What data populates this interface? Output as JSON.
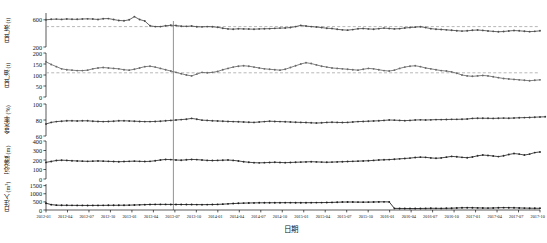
{
  "chart_data": {
    "type": "line",
    "title": "",
    "xlabel": "日期",
    "grid": false,
    "legend": "none",
    "layout": "5 stacked panels sharing one x axis",
    "x": [
      "2012-01",
      "2012-04",
      "2012-07",
      "2012-10",
      "2013-01",
      "2013-04",
      "2013-07",
      "2013-10",
      "2014-01",
      "2014-04",
      "2014-07",
      "2014-10",
      "2015-01",
      "2015-04",
      "2015-07",
      "2015-10",
      "2016-01",
      "2016-04",
      "2016-07",
      "2016-10",
      "2017-01",
      "2017-04",
      "2017-07",
      "2017-10"
    ],
    "xtick_labels": [
      "2012-01",
      "2012-04",
      "2012-07",
      "2012-10",
      "2013-01",
      "2013-04",
      "2013-07",
      "2013-10",
      "2014-01",
      "2014-04",
      "2014-07",
      "2014-10",
      "2015-01",
      "2015-04",
      "2015-07",
      "2015-10",
      "2016-01",
      "2016-04",
      "2016-07",
      "2016-10",
      "2017-01",
      "2017-04",
      "2017-07",
      "2017-10"
    ],
    "marker_line": {
      "x": "2013-06",
      "label": ""
    },
    "panels": [
      {
        "name": "日产液",
        "ylabel": "日产液 (t)",
        "ylim": [
          200,
          700
        ],
        "yticks": [
          200,
          600
        ],
        "ytick_labels": [
          "200",
          "600"
        ],
        "refline": 500,
        "color": "#4d4d4d",
        "values": [
          600,
          607,
          610,
          606,
          612,
          608,
          607,
          612,
          614,
          611,
          605,
          616,
          618,
          604,
          590,
          586,
          600,
          646,
          604,
          582,
          512,
          500,
          500,
          512,
          520,
          516,
          506,
          504,
          508,
          498,
          496,
          500,
          498,
          490,
          476,
          466,
          462,
          468,
          466,
          464,
          462,
          466,
          468,
          470,
          474,
          478,
          480,
          486,
          500,
          518,
          508,
          500,
          494,
          486,
          476,
          472,
          460,
          452,
          448,
          456,
          468,
          472,
          466,
          462,
          470,
          478,
          472,
          466,
          470,
          480,
          486,
          492,
          498,
          486,
          470,
          462,
          458,
          452,
          446,
          440,
          434,
          438,
          446,
          450,
          444,
          436,
          430,
          424,
          428,
          436,
          442,
          438,
          432,
          426,
          430,
          438
        ]
      },
      {
        "name": "日产油",
        "ylabel": "日产油 (t)",
        "ylim": [
          0,
          200
        ],
        "yticks": [
          0,
          50,
          100,
          150,
          200
        ],
        "ytick_labels": [
          "0",
          "50",
          "100",
          "150",
          "200"
        ],
        "refline": 110,
        "color": "#6a6a6a",
        "values": [
          160,
          148,
          138,
          128,
          124,
          122,
          120,
          120,
          122,
          128,
          132,
          134,
          132,
          130,
          128,
          124,
          122,
          126,
          132,
          138,
          140,
          136,
          130,
          124,
          118,
          112,
          106,
          100,
          96,
          104,
          112,
          110,
          112,
          116,
          124,
          130,
          136,
          140,
          142,
          140,
          136,
          132,
          128,
          126,
          124,
          122,
          126,
          134,
          142,
          150,
          156,
          152,
          146,
          140,
          136,
          132,
          130,
          128,
          126,
          124,
          122,
          126,
          130,
          128,
          124,
          120,
          118,
          122,
          130,
          136,
          140,
          142,
          138,
          132,
          128,
          124,
          120,
          118,
          114,
          108,
          100,
          96,
          94,
          96,
          98,
          96,
          92,
          88,
          84,
          82,
          80,
          78,
          76,
          74,
          76,
          78
        ]
      },
      {
        "name": "含水率",
        "ylabel": "含水率 (%)",
        "ylim": [
          60,
          100
        ],
        "yticks": [
          60,
          80,
          100
        ],
        "ytick_labels": [
          "60",
          "80",
          "100"
        ],
        "refline": null,
        "color": "#3a3a3a",
        "values": [
          75,
          77,
          78,
          78.5,
          79,
          79,
          78.8,
          79,
          79,
          78.5,
          78.2,
          78,
          78.2,
          78.5,
          79,
          79,
          78.8,
          78.5,
          78.2,
          78,
          78,
          78.2,
          78.5,
          79,
          79.5,
          80,
          80.5,
          81,
          82,
          81,
          79.8,
          79.5,
          79,
          78.8,
          78.5,
          78.2,
          78,
          77.8,
          77.5,
          77.2,
          77,
          77.5,
          78,
          78.5,
          78.2,
          78,
          77.8,
          77.5,
          77.2,
          77,
          76.8,
          76.5,
          76.2,
          76.5,
          77,
          77.2,
          77,
          76.8,
          77,
          77.5,
          78,
          78.2,
          78.5,
          78.8,
          79,
          79.5,
          80,
          79.8,
          79.5,
          79.2,
          79.5,
          80,
          80.2,
          80,
          80.2,
          80.5,
          80.5,
          80.6,
          80.8,
          80.8,
          81,
          81.2,
          82,
          82.2,
          82.2,
          82.1,
          82,
          82.2,
          82.4,
          82.2,
          82.5,
          82.8,
          83,
          83.2,
          83.5,
          83.8,
          84
        ]
      },
      {
        "name": "沉没度",
        "ylabel": "沉没度 (m)",
        "ylim": [
          0,
          400
        ],
        "yticks": [
          0,
          100,
          200,
          300,
          400
        ],
        "ytick_labels": [
          "0",
          "100",
          "200",
          "300",
          "400"
        ],
        "refline": null,
        "color": "#2a2a2a",
        "values": [
          175,
          185,
          195,
          198,
          196,
          192,
          190,
          188,
          186,
          188,
          190,
          188,
          186,
          184,
          182,
          184,
          186,
          188,
          186,
          184,
          186,
          192,
          200,
          206,
          204,
          200,
          198,
          202,
          206,
          204,
          200,
          196,
          194,
          196,
          198,
          200,
          196,
          190,
          182,
          176,
          172,
          170,
          172,
          174,
          176,
          174,
          172,
          174,
          176,
          178,
          180,
          182,
          180,
          178,
          176,
          178,
          180,
          182,
          184,
          186,
          188,
          190,
          192,
          196,
          200,
          202,
          204,
          208,
          212,
          216,
          220,
          226,
          230,
          228,
          222,
          218,
          222,
          230,
          238,
          234,
          228,
          224,
          232,
          244,
          252,
          248,
          242,
          236,
          244,
          258,
          268,
          262,
          252,
          262,
          278,
          285
        ]
      },
      {
        "name": "日注入",
        "ylabel": "日注入 (m³)",
        "ylim": [
          0,
          1600
        ],
        "yticks": [
          0,
          500,
          1000,
          1500
        ],
        "ytick_labels": [
          "0",
          "500",
          "1000",
          "1500"
        ],
        "refline": null,
        "color": "#1a1a1a",
        "values": [
          420,
          330,
          300,
          290,
          288,
          286,
          284,
          282,
          280,
          282,
          284,
          286,
          288,
          290,
          292,
          294,
          300,
          308,
          318,
          330,
          340,
          344,
          346,
          344,
          342,
          340,
          338,
          336,
          334,
          332,
          330,
          332,
          336,
          346,
          360,
          378,
          396,
          412,
          424,
          432,
          438,
          442,
          444,
          446,
          448,
          450,
          452,
          452,
          450,
          448,
          450,
          452,
          454,
          456,
          460,
          468,
          478,
          488,
          492,
          490,
          486,
          484,
          486,
          492,
          500,
          502,
          498,
          100,
          96,
          94,
          92,
          90,
          94,
          100,
          104,
          102,
          100,
          104,
          112,
          124,
          136,
          142,
          138,
          130,
          122,
          118,
          124,
          136,
          146,
          142,
          134,
          126,
          118,
          112,
          108,
          104
        ]
      }
    ]
  }
}
